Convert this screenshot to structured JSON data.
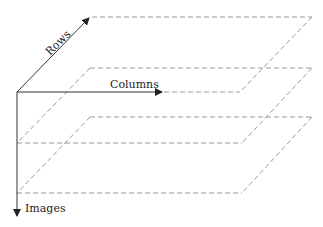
{
  "diagram": {
    "axes": [
      {
        "id": "rows",
        "label": "Rows",
        "direction": "diagonal-up-right"
      },
      {
        "id": "columns",
        "label": "Columns",
        "direction": "right"
      },
      {
        "id": "images",
        "label": "Images",
        "direction": "down"
      }
    ],
    "planes": [
      {
        "index": 0,
        "style": "dashed"
      },
      {
        "index": 1,
        "style": "dashed"
      },
      {
        "index": 2,
        "style": "dashed"
      }
    ],
    "colors": {
      "axis": "#333333",
      "plane": "#9a9a9a",
      "text": "#222222"
    }
  }
}
